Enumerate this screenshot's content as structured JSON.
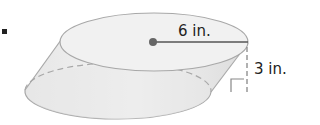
{
  "figure": {
    "type": "oblique-cylinder",
    "radius_label": "6 in.",
    "height_label": "3 in.",
    "colors": {
      "fill_light": "#f3f3f3",
      "fill_shade": "#e2e2e2",
      "stroke": "#a8a8a8",
      "radius_line": "#555555",
      "center_dot": "#666666",
      "height_dash": "#888888"
    }
  }
}
